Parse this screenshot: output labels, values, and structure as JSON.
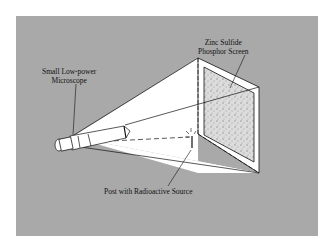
{
  "figure": {
    "labels": {
      "screen_line1": "Zinc Sulfide",
      "screen_line2": "Phosphor Screen",
      "microscope_line1": "Small Low-power",
      "microscope_line2": "Microscope",
      "source": "Post with Radioactive Source"
    },
    "colors": {
      "background": "#a9a9a9",
      "beam": "#ffffff",
      "ink": "#111111",
      "screen_fill": "#d8d8d8"
    }
  }
}
